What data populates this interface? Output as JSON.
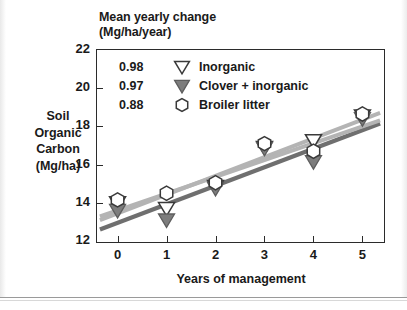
{
  "header": {
    "line1": "Mean yearly change",
    "line2": "(Mg/ha/year)"
  },
  "axes": {
    "ylabel_lines": [
      "Soil",
      "Organic",
      "Carbon",
      "(Mg/ha)"
    ],
    "xlabel": "Years of management"
  },
  "legend": [
    {
      "value": "0.98",
      "marker": "triangle-down-open",
      "label": "Inorganic"
    },
    {
      "value": "0.97",
      "marker": "triangle-down-filled",
      "label": "Clover + inorganic"
    },
    {
      "value": "0.88",
      "marker": "hexagon-open",
      "label": "Broiler litter"
    }
  ],
  "colors": {
    "axis": "#2b2b2b",
    "text": "#1a1a1a",
    "line_light": "#b4b4b4",
    "line_dark": "#6f6f6f",
    "marker_fill_dark": "#7d7d7d",
    "marker_fill_open": "#ffffff",
    "marker_stroke": "#3a3a3a"
  },
  "chart_data": {
    "type": "scatter",
    "title": "Mean yearly change (Mg/ha/year)",
    "xlabel": "Years of management",
    "ylabel": "Soil Organic Carbon (Mg/ha)",
    "xlim": [
      -0.42,
      5.42
    ],
    "ylim": [
      12,
      22
    ],
    "xticks": [
      0,
      1,
      2,
      3,
      4,
      5
    ],
    "yticks": [
      12,
      14,
      16,
      18,
      20,
      22
    ],
    "xticklabels": [
      "0",
      "1",
      "2",
      "3",
      "4",
      "5"
    ],
    "yticklabels": [
      "12",
      "14",
      "16",
      "18",
      "20",
      "22"
    ],
    "grid": false,
    "legend_position": "upper-left-inside",
    "x": [
      0,
      1,
      2,
      3,
      4,
      5
    ],
    "series": [
      {
        "name": "Inorganic",
        "slope_label": "0.98",
        "marker": "triangle-down-open",
        "values": [
          14.0,
          13.7,
          14.85,
          16.9,
          17.25,
          18.55
        ],
        "fit": {
          "intercept": 13.45,
          "slope": 0.98,
          "color": "#b4b4b4"
        }
      },
      {
        "name": "Clover + inorganic",
        "slope_label": "0.97",
        "marker": "triangle-down-filled",
        "values": [
          13.6,
          13.1,
          14.75,
          16.85,
          16.15,
          18.4
        ],
        "fit": {
          "intercept": 12.95,
          "slope": 0.97,
          "color": "#6f6f6f"
        }
      },
      {
        "name": "Broiler litter",
        "slope_label": "0.88",
        "marker": "hexagon-open",
        "values": [
          14.15,
          14.5,
          15.05,
          17.1,
          16.7,
          18.65
        ],
        "fit": {
          "intercept": 13.6,
          "slope": 0.88,
          "color": "#b4b4b4"
        }
      }
    ]
  }
}
